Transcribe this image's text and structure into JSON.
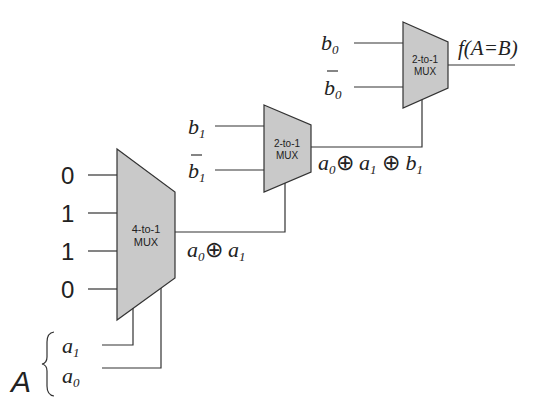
{
  "diagram": {
    "mux_4to1": {
      "line1": "4-to-1",
      "line2": "MUX",
      "inputs": [
        "0",
        "1",
        "1",
        "0"
      ]
    },
    "mux_middle": {
      "line1": "2-to-1",
      "line2": "MUX",
      "input_top": "b",
      "input_top_sub": "1",
      "input_bottom": "b",
      "input_bottom_sub": "1"
    },
    "mux_top": {
      "line1": "2-to-1",
      "line2": "MUX",
      "input_top": "b",
      "input_top_sub": "0",
      "input_bottom": "b",
      "input_bottom_sub": "0"
    },
    "signals": {
      "out_4to1": {
        "a": "a",
        "a0": "0",
        "op": "⊕",
        "b": "a",
        "b1": "1"
      },
      "out_middle": {
        "a": "a",
        "a0": "0",
        "op1": "⊕",
        "b": "a",
        "b1": "1",
        "op2": "⊕",
        "c": "b",
        "c1": "1"
      },
      "output": "f(A=B)"
    },
    "select": {
      "group_label": "A",
      "a1": "a",
      "a1_sub": "1",
      "a0": "a",
      "a0_sub": "0"
    },
    "colors": {
      "mux_fill": "#c9c9c9",
      "stroke": "#333333"
    }
  }
}
